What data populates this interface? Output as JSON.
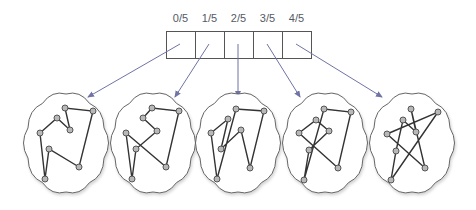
{
  "diagram": {
    "labels": [
      "0/5",
      "1/5",
      "2/5",
      "3/5",
      "4/5"
    ],
    "colors": {
      "box_stroke": "#555555",
      "arrow": "#6f73a6",
      "cloud_stroke": "#555555",
      "edge": "#333333",
      "node_fill": "#b8b8b8",
      "node_stroke": "#555555"
    },
    "boxes": {
      "x": 166,
      "y": 31,
      "w": 29,
      "h": 27,
      "count": 5
    },
    "arrows": [
      {
        "from": [
          180,
          44
        ],
        "to": [
          88,
          97
        ]
      },
      {
        "from": [
          209,
          44
        ],
        "to": [
          175,
          97
        ]
      },
      {
        "from": [
          238,
          44
        ],
        "to": [
          238,
          97
        ]
      },
      {
        "from": [
          267,
          44
        ],
        "to": [
          300,
          97
        ]
      },
      {
        "from": [
          296,
          44
        ],
        "to": [
          382,
          97
        ]
      }
    ],
    "clouds": [
      {
        "cx": 66,
        "cy": 143,
        "nodes": [
          [
            65,
            108
          ],
          [
            93,
            111
          ],
          [
            57,
            118
          ],
          [
            70,
            130
          ],
          [
            40,
            133
          ],
          [
            49,
            149
          ],
          [
            79,
            167
          ],
          [
            45,
            179
          ]
        ],
        "tour": [
          7,
          4,
          2,
          3,
          0,
          1,
          6,
          5,
          7
        ]
      },
      {
        "cx": 153,
        "cy": 143,
        "nodes": [
          [
            152,
            108
          ],
          [
            179,
            111
          ],
          [
            143,
            118
          ],
          [
            157,
            131
          ],
          [
            126,
            133
          ],
          [
            136,
            149
          ],
          [
            166,
            167
          ],
          [
            132,
            179
          ]
        ],
        "tour": [
          4,
          6,
          1,
          0,
          2,
          3,
          5,
          7,
          4
        ]
      },
      {
        "cx": 238,
        "cy": 143,
        "nodes": [
          [
            236,
            109
          ],
          [
            264,
            111
          ],
          [
            228,
            119
          ],
          [
            241,
            130
          ],
          [
            211,
            133
          ],
          [
            221,
            149
          ],
          [
            250,
            168
          ],
          [
            217,
            179
          ]
        ],
        "tour": [
          7,
          4,
          2,
          5,
          3,
          6,
          1,
          0,
          7
        ]
      },
      {
        "cx": 325,
        "cy": 143,
        "nodes": [
          [
            324,
            109
          ],
          [
            351,
            112
          ],
          [
            316,
            120
          ],
          [
            329,
            131
          ],
          [
            299,
            133
          ],
          [
            309,
            150
          ],
          [
            338,
            168
          ],
          [
            304,
            180
          ]
        ],
        "tour": [
          7,
          0,
          1,
          6,
          4,
          2,
          3,
          5,
          7
        ]
      },
      {
        "cx": 412,
        "cy": 143,
        "nodes": [
          [
            411,
            109
          ],
          [
            438,
            112
          ],
          [
            403,
            120
          ],
          [
            416,
            132
          ],
          [
            387,
            134
          ],
          [
            396,
            151
          ],
          [
            425,
            168
          ],
          [
            391,
            180
          ]
        ],
        "tour": [
          4,
          1,
          7,
          5,
          2,
          3,
          0,
          6,
          4
        ]
      }
    ]
  }
}
